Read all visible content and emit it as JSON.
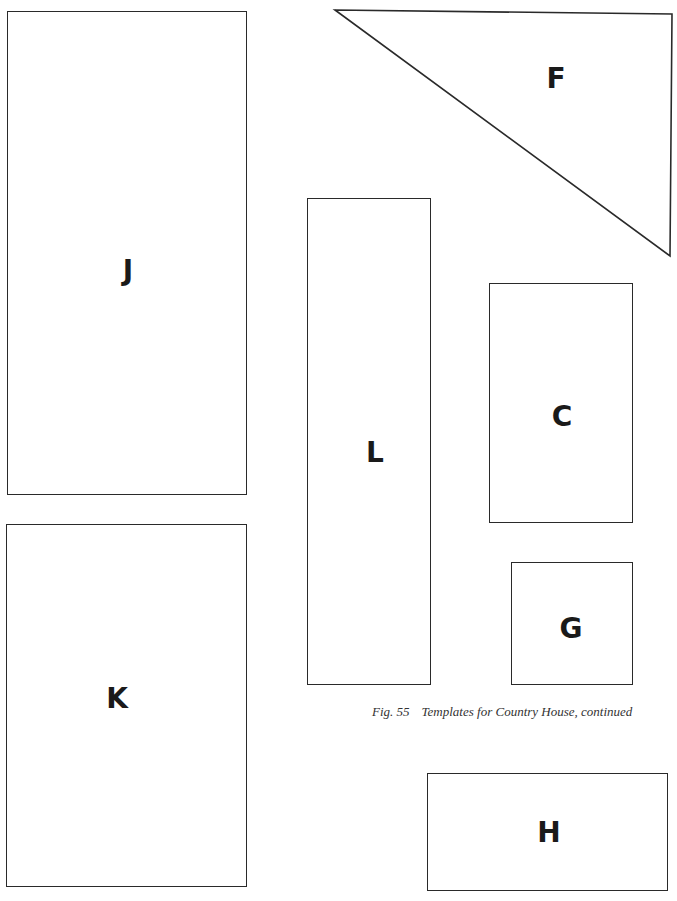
{
  "caption": {
    "figure": "Fig. 55",
    "text": "Templates for Country House, continued"
  },
  "templates": {
    "J": {
      "label": "J",
      "shape": "rectangle"
    },
    "K": {
      "label": "K",
      "shape": "rectangle"
    },
    "F": {
      "label": "F",
      "shape": "right-triangle"
    },
    "L": {
      "label": "L",
      "shape": "rectangle"
    },
    "C": {
      "label": "C",
      "shape": "rectangle"
    },
    "G": {
      "label": "G",
      "shape": "square"
    },
    "H": {
      "label": "H",
      "shape": "rectangle"
    }
  },
  "colors": {
    "line": "#2a2a2a",
    "background": "#ffffff"
  }
}
